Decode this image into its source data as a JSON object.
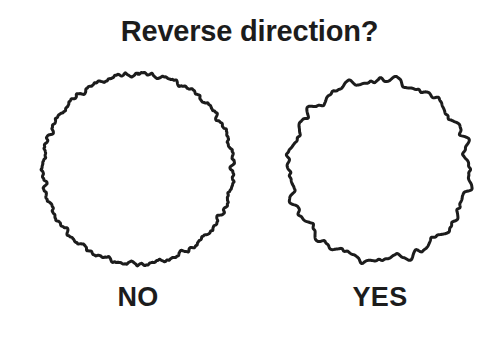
{
  "canvas": {
    "width": 499,
    "height": 340,
    "background_color": "#ffffff",
    "ink_color": "#1c1c1c"
  },
  "title": {
    "text": "Reverse direction?",
    "color": "#1c1c1c"
  },
  "figures": [
    {
      "id": "no",
      "label": "NO",
      "shape": "noisy-circle",
      "description": "circle with fine low-amplitude high-frequency wavy outline",
      "center": {
        "x": 120,
        "y": 111
      },
      "radius": 95,
      "stroke_width": 3,
      "stroke_color": "#1c1c1c",
      "fill": "none",
      "noise": {
        "amplitude": 2.6,
        "frequency": 46,
        "detail_amplitude": 1.3,
        "detail_frequency": 113,
        "seed": 17,
        "samples": 900
      }
    },
    {
      "id": "yes",
      "label": "YES",
      "shape": "noisy-circle",
      "description": "circle with larger-amplitude lower-frequency jagged spiky outline",
      "center": {
        "x": 111,
        "y": 112
      },
      "radius": 90,
      "stroke_width": 3,
      "stroke_color": "#1c1c1c",
      "fill": "none",
      "noise": {
        "amplitude": 5.4,
        "frequency": 24,
        "detail_amplitude": 2.2,
        "detail_frequency": 57,
        "seed": 91,
        "samples": 900
      }
    }
  ]
}
